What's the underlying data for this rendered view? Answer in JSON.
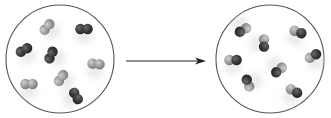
{
  "diagram": {
    "type": "reaction-schematic",
    "colors": {
      "dark_atom": "#3a3a3a",
      "light_atom": "#9a9a9a",
      "container_stroke": "#555555",
      "arrow": "#222222",
      "shadow": "#d8d8d8"
    },
    "arrow": {
      "x1": 126,
      "y1": 61,
      "x2": 206,
      "y2": 61,
      "direction": "right"
    },
    "containers": [
      {
        "id": "reactants",
        "cx": 60,
        "cy": 59,
        "r": 54,
        "molecules": [
          {
            "kind": "light-light",
            "x": 47,
            "y": 27,
            "angle": -50
          },
          {
            "kind": "dark-dark",
            "x": 84,
            "y": 29,
            "angle": 0
          },
          {
            "kind": "dark-dark",
            "x": 24,
            "y": 50,
            "angle": -30
          },
          {
            "kind": "dark-dark",
            "x": 51,
            "y": 55,
            "angle": -65
          },
          {
            "kind": "light-light",
            "x": 96,
            "y": 64,
            "angle": 5
          },
          {
            "kind": "light-light",
            "x": 61,
            "y": 78,
            "angle": -55
          },
          {
            "kind": "light-light",
            "x": 29,
            "y": 84,
            "angle": 0
          },
          {
            "kind": "dark-dark",
            "x": 76,
            "y": 96,
            "angle": 60
          }
        ]
      },
      {
        "id": "products",
        "cx": 270,
        "cy": 59,
        "r": 54,
        "molecules": [
          {
            "kind": "light-dark",
            "x": 243,
            "y": 30,
            "angle": 150
          },
          {
            "kind": "light-dark",
            "x": 264,
            "y": 43,
            "angle": 90
          },
          {
            "kind": "light-dark",
            "x": 298,
            "y": 32,
            "angle": 20
          },
          {
            "kind": "light-dark",
            "x": 313,
            "y": 56,
            "angle": -30
          },
          {
            "kind": "light-dark",
            "x": 233,
            "y": 60,
            "angle": 0
          },
          {
            "kind": "light-dark",
            "x": 279,
            "y": 70,
            "angle": 140
          },
          {
            "kind": "light-dark",
            "x": 248,
            "y": 83,
            "angle": -110
          },
          {
            "kind": "light-dark",
            "x": 294,
            "y": 91,
            "angle": 30
          }
        ]
      }
    ]
  }
}
